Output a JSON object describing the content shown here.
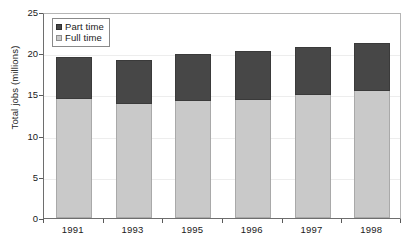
{
  "chart_data": {
    "type": "bar",
    "subtype": "stacked-vertical",
    "title": "",
    "xlabel": "",
    "ylabel": "Total jobs (millions)",
    "ylim": [
      0,
      25
    ],
    "yticks": [
      0,
      5,
      10,
      15,
      20,
      25
    ],
    "ytick_labels": [
      "0",
      "5",
      "10",
      "15",
      "20",
      "25"
    ],
    "grid": true,
    "grid_axis": "y",
    "legend_position": "top-left-inside",
    "categories": [
      "1991",
      "1993",
      "1995",
      "1996",
      "1997",
      "1998"
    ],
    "series": [
      {
        "name": "Full time",
        "color": "#c9c9c9",
        "values": [
          14.4,
          13.8,
          14.2,
          14.3,
          14.9,
          15.4
        ]
      },
      {
        "name": "Part time",
        "color": "#474747",
        "values": [
          5.2,
          5.4,
          5.7,
          6.0,
          5.9,
          5.9
        ]
      }
    ],
    "totals": [
      19.6,
      19.2,
      19.9,
      20.3,
      20.8,
      21.3
    ],
    "stack_order": [
      "Full time",
      "Part time"
    ]
  },
  "legend": {
    "items": [
      {
        "label": "Part time",
        "swatch": "dark-gray-swatch"
      },
      {
        "label": "Full time",
        "swatch": "light-gray-swatch"
      }
    ]
  },
  "axes": {
    "y_title": "Total jobs (millions)",
    "y_labels": [
      "25",
      "20",
      "15",
      "10",
      "5",
      "0"
    ],
    "x_labels": [
      "1991",
      "1993",
      "1995",
      "1996",
      "1997",
      "1998"
    ]
  },
  "caption_sliver": "",
  "colors": {
    "part_time": "#474747",
    "full_time": "#c9c9c9",
    "axis": "#6e6e6e",
    "gridline": "#ededed",
    "background": "#ffffff",
    "text": "#1a1a1a"
  }
}
